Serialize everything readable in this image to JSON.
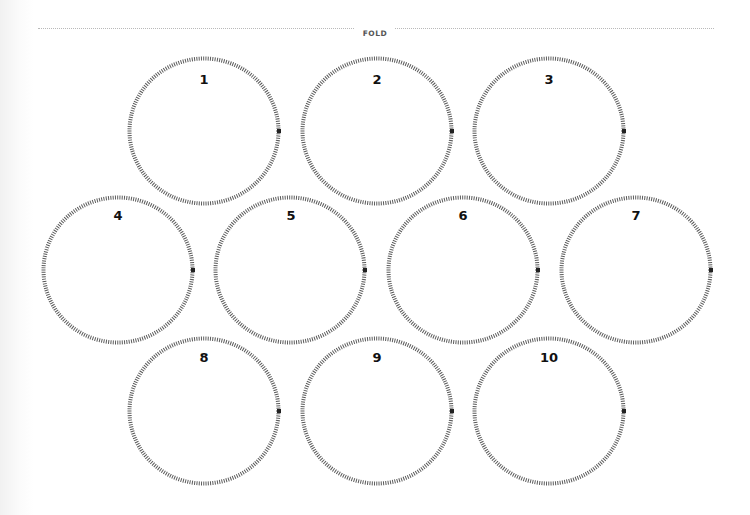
{
  "fold": {
    "label": "FOLD"
  },
  "style": {
    "ring_color": "#5a5a5a",
    "marker_color": "#222222",
    "label_color": "#111111"
  },
  "circles": [
    {
      "label": "1",
      "cx": 204,
      "cy": 131
    },
    {
      "label": "2",
      "cx": 377,
      "cy": 131
    },
    {
      "label": "3",
      "cx": 549,
      "cy": 131
    },
    {
      "label": "4",
      "cx": 118,
      "cy": 270
    },
    {
      "label": "5",
      "cx": 290,
      "cy": 270
    },
    {
      "label": "6",
      "cx": 463,
      "cy": 270
    },
    {
      "label": "7",
      "cx": 636,
      "cy": 270
    },
    {
      "label": "8",
      "cx": 204,
      "cy": 411
    },
    {
      "label": "9",
      "cx": 377,
      "cy": 411
    },
    {
      "label": "10",
      "cx": 549,
      "cy": 411
    }
  ]
}
